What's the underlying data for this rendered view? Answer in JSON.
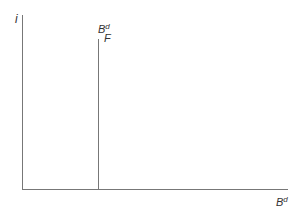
{
  "diagram": {
    "y_axis_label": "i",
    "x_axis_label": "B",
    "x_axis_label_sup": "d",
    "curve_label": "B",
    "curve_label_sup": "d",
    "curve_label_sub": "F",
    "curve_type": "vertical line (perfectly inelastic supply)"
  }
}
